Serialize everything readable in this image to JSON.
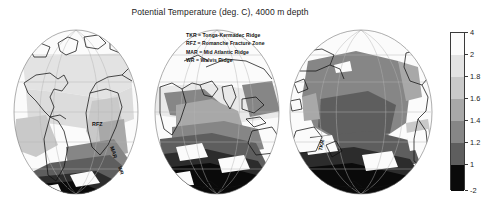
{
  "title": "Potential Temperature (deg. C), 4000 m depth",
  "legend": {
    "entries": [
      "TKR = Tonga-Kermadec Ridge",
      "RFZ = Romanche Fracture Zone",
      "MAR = Mid Atlantic Ridge",
      "WR = Walvis Ridge"
    ]
  },
  "chart_data": {
    "type": "heatmap",
    "title": "Potential Temperature (deg. C), 4000 m depth",
    "subtitle": "",
    "xlabel": "",
    "ylabel": "",
    "projection": "three orthographic hemispheres (Atlantic, Indian, Pacific)",
    "variable": "Potential Temperature",
    "units": "deg. C",
    "depth_m": 4000,
    "grid": true,
    "legend_position": "right",
    "colorbar": {
      "orientation": "vertical",
      "ticks": [
        "4",
        "2",
        "1.8",
        "1.6",
        "1.4",
        "1.2",
        "1",
        "-2"
      ],
      "tick_values": [
        4,
        2,
        1.8,
        1.6,
        1.4,
        1.2,
        1,
        -2
      ],
      "vmin": -2,
      "vmax": 4,
      "scale": "nonlinear discrete bands",
      "bands": [
        {
          "range": [
            2,
            4
          ],
          "color": "#fbfbfb",
          "label": "2 to 4"
        },
        {
          "range": [
            1.8,
            2
          ],
          "color": "#e3e3e3",
          "label": "1.8 to 2"
        },
        {
          "range": [
            1.6,
            1.8
          ],
          "color": "#c9c9c9",
          "label": "1.6 to 1.8"
        },
        {
          "range": [
            1.4,
            1.6
          ],
          "color": "#a8a8a8",
          "label": "1.4 to 1.6"
        },
        {
          "range": [
            1.2,
            1.4
          ],
          "color": "#868686",
          "label": "1.2 to 1.4"
        },
        {
          "range": [
            1,
            1.2
          ],
          "color": "#5e5e5e",
          "label": "1 to 1.2"
        },
        {
          "range": [
            -2,
            1
          ],
          "color": "#0a0a0a",
          "label": "-2 to 1"
        }
      ]
    },
    "panels": [
      {
        "name": "Atlantic hemisphere",
        "center_lon": -30,
        "annotations": [
          "RFZ",
          "MAR",
          "WR"
        ],
        "description": "Americas, Africa and Antarctica; warm (light) North Atlantic, cold (dark) Southern Ocean bottom water"
      },
      {
        "name": "Indian hemisphere",
        "center_lon": 75,
        "annotations": [],
        "description": "Africa, Asia and Australia; mid-gray Indian basin with dark southern band"
      },
      {
        "name": "Pacific hemisphere",
        "center_lon": 200,
        "annotations": [
          "TKR"
        ],
        "description": "Pacific basin dominated by 1.4-1.6 deg C mid-gray water, dark Southern Ocean margin"
      }
    ],
    "annotation_definitions": {
      "TKR": "Tonga-Kermadec Ridge",
      "RFZ": "Romanche Fracture Zone",
      "MAR": "Mid Atlantic Ridge",
      "WR": "Walvis Ridge"
    }
  }
}
